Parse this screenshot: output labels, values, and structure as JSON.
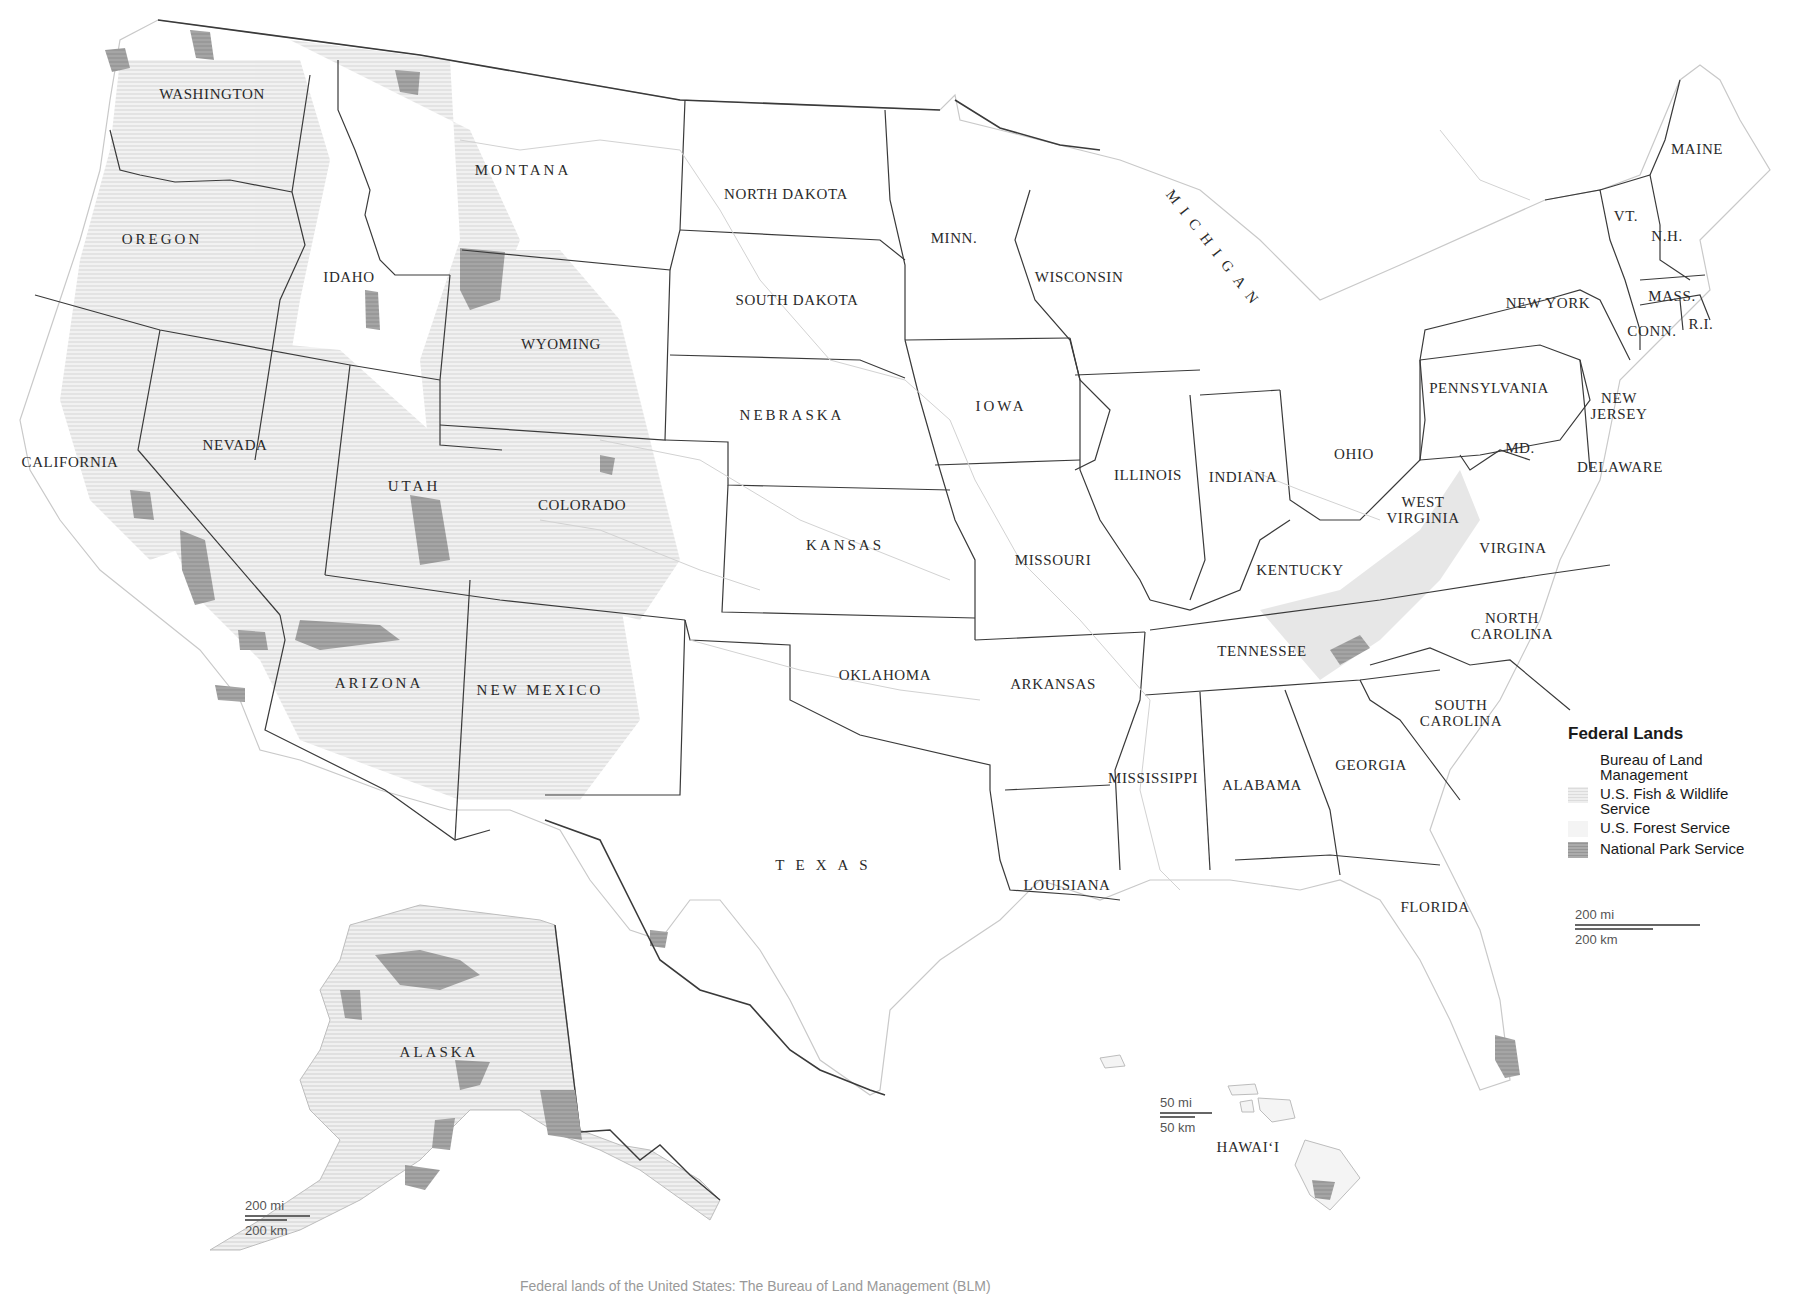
{
  "map": {
    "title": "Federal Lands",
    "states": [
      {
        "id": "washington",
        "label": "WASHINGTON",
        "x": 212,
        "y": 94
      },
      {
        "id": "montana",
        "label": "MONTANA",
        "x": 523,
        "y": 170,
        "style": "wide"
      },
      {
        "id": "oregon",
        "label": "OREGON",
        "x": 162,
        "y": 239,
        "style": "wide"
      },
      {
        "id": "idaho",
        "label": "IDAHO",
        "x": 349,
        "y": 277
      },
      {
        "id": "wyoming",
        "label": "WYOMING",
        "x": 561,
        "y": 344
      },
      {
        "id": "north-dakota",
        "label": "NORTH DAKOTA",
        "x": 786,
        "y": 194
      },
      {
        "id": "south-dakota",
        "label": "SOUTH DAKOTA",
        "x": 797,
        "y": 300
      },
      {
        "id": "minnesota",
        "label": "MINN.",
        "x": 954,
        "y": 238
      },
      {
        "id": "wisconsin",
        "label": "WISCONSIN",
        "x": 1079,
        "y": 277
      },
      {
        "id": "michigan",
        "label": "MICHIGAN",
        "x": 1215,
        "y": 250,
        "style": "rot"
      },
      {
        "id": "new-york",
        "label": "NEW YORK",
        "x": 1548,
        "y": 303
      },
      {
        "id": "maine",
        "label": "MAINE",
        "x": 1697,
        "y": 149
      },
      {
        "id": "vermont",
        "label": "VT.",
        "x": 1626,
        "y": 216
      },
      {
        "id": "new-hampshire",
        "label": "N.H.",
        "x": 1667,
        "y": 236
      },
      {
        "id": "massachusetts",
        "label": "MASS.",
        "x": 1672,
        "y": 296
      },
      {
        "id": "connecticut",
        "label": "CONN.",
        "x": 1652,
        "y": 331
      },
      {
        "id": "rhode-island",
        "label": "R.I.",
        "x": 1701,
        "y": 324
      },
      {
        "id": "pennsylvania",
        "label": "PENNSYLVANIA",
        "x": 1489,
        "y": 388
      },
      {
        "id": "new-jersey",
        "label": "NEW\nJERSEY",
        "x": 1619,
        "y": 406
      },
      {
        "id": "maryland",
        "label": "MD.",
        "x": 1520,
        "y": 448
      },
      {
        "id": "delaware",
        "label": "DELAWARE",
        "x": 1620,
        "y": 467
      },
      {
        "id": "nebraska",
        "label": "NEBRASKA",
        "x": 792,
        "y": 415,
        "style": "wide"
      },
      {
        "id": "iowa",
        "label": "IOWA",
        "x": 1001,
        "y": 406,
        "style": "wide"
      },
      {
        "id": "california",
        "label": "CALIFORNIA",
        "x": 70,
        "y": 462
      },
      {
        "id": "nevada",
        "label": "NEVADA",
        "x": 235,
        "y": 445
      },
      {
        "id": "utah",
        "label": "UTAH",
        "x": 414,
        "y": 486,
        "style": "wide"
      },
      {
        "id": "colorado",
        "label": "COLORADO",
        "x": 582,
        "y": 505
      },
      {
        "id": "illinois",
        "label": "ILLINOIS",
        "x": 1148,
        "y": 475
      },
      {
        "id": "indiana",
        "label": "INDIANA",
        "x": 1243,
        "y": 477
      },
      {
        "id": "ohio",
        "label": "OHIO",
        "x": 1354,
        "y": 454
      },
      {
        "id": "west-virginia",
        "label": "WEST\nVIRGINIA",
        "x": 1423,
        "y": 510
      },
      {
        "id": "kansas",
        "label": "KANSAS",
        "x": 845,
        "y": 545,
        "style": "wide"
      },
      {
        "id": "missouri",
        "label": "MISSOURI",
        "x": 1053,
        "y": 560
      },
      {
        "id": "kentucky",
        "label": "KENTUCKY",
        "x": 1300,
        "y": 570
      },
      {
        "id": "virginia",
        "label": "VIRGINA",
        "x": 1513,
        "y": 548
      },
      {
        "id": "north-carolina",
        "label": "NORTH\nCAROLINA",
        "x": 1512,
        "y": 626
      },
      {
        "id": "tennessee",
        "label": "TENNESSEE",
        "x": 1262,
        "y": 651
      },
      {
        "id": "oklahoma",
        "label": "OKLAHOMA",
        "x": 885,
        "y": 675
      },
      {
        "id": "arkansas",
        "label": "ARKANSAS",
        "x": 1053,
        "y": 684
      },
      {
        "id": "arizona",
        "label": "ARIZONA",
        "x": 379,
        "y": 683,
        "style": "wide"
      },
      {
        "id": "new-mexico",
        "label": "NEW MEXICO",
        "x": 540,
        "y": 690,
        "style": "wide"
      },
      {
        "id": "south-carolina",
        "label": "SOUTH\nCAROLINA",
        "x": 1461,
        "y": 713
      },
      {
        "id": "georgia",
        "label": "GEORGIA",
        "x": 1371,
        "y": 765
      },
      {
        "id": "mississippi",
        "label": "MISSISSIPPI",
        "x": 1153,
        "y": 778
      },
      {
        "id": "alabama",
        "label": "ALABAMA",
        "x": 1262,
        "y": 785
      },
      {
        "id": "texas",
        "label": "TEXAS",
        "x": 827,
        "y": 865,
        "style": "xwide"
      },
      {
        "id": "louisiana",
        "label": "LOUISIANA",
        "x": 1067,
        "y": 885
      },
      {
        "id": "florida",
        "label": "FLORIDA",
        "x": 1435,
        "y": 907
      },
      {
        "id": "alaska",
        "label": "ALASKA",
        "x": 439,
        "y": 1052,
        "style": "wide"
      },
      {
        "id": "hawaii",
        "label": "HAWAIʻI",
        "x": 1248,
        "y": 1147
      }
    ]
  },
  "legend": {
    "title": "Federal Lands",
    "items": [
      {
        "label": "Bureau of Land\nManagement",
        "color": "#ffffff",
        "pattern": "none"
      },
      {
        "label": "U.S. Fish & Wildlife\nService",
        "color": "#e6e6e6",
        "pattern": "hatch"
      },
      {
        "label": "U.S. Forest Service",
        "color": "#f2f2f2",
        "pattern": "none"
      },
      {
        "label": "National Park Service",
        "color": "#a8a8a8",
        "pattern": "hatch"
      }
    ]
  },
  "scales": {
    "main": {
      "mi": "200 mi",
      "km": "200 km"
    },
    "alaska": {
      "mi": "200 mi",
      "km": "200 km"
    },
    "hawaii": {
      "mi": "50 mi",
      "km": "50 km"
    }
  },
  "caption": {
    "text": "Federal lands of the United States: The Bureau of Land Management (BLM)"
  },
  "colors": {
    "border": "#3a3a3a",
    "relief": "#d8d8d8",
    "park": "#9a9a9a",
    "background": "#ffffff"
  }
}
